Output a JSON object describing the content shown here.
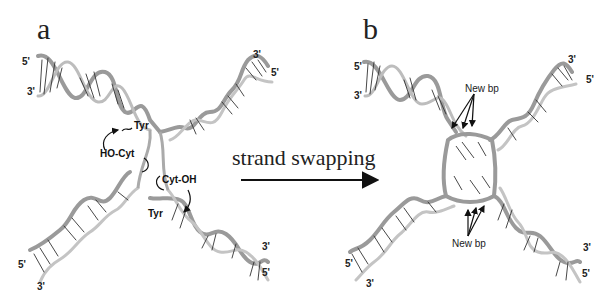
{
  "panels": {
    "a": {
      "label": "a",
      "ends": {
        "top_left_5": "5'",
        "top_left_3": "3'",
        "top_right_3": "3'",
        "top_right_5": "5'",
        "bottom_left_5": "5'",
        "bottom_left_3": "3'",
        "bottom_right_3": "3'",
        "bottom_right_5": "5'"
      },
      "annotations": {
        "tyr_top": "Tyr",
        "ho_cyt": "HO-Cyt",
        "cyt_oh": "Cyt-OH",
        "tyr_bottom": "Tyr"
      }
    },
    "b": {
      "label": "b",
      "ends": {
        "top_left_5": "5'",
        "top_left_3": "3'",
        "top_right_3": "3'",
        "top_right_5": "5'",
        "bottom_left_5": "5'",
        "bottom_left_3": "3'",
        "bottom_right_3": "3'",
        "bottom_right_5": "5'"
      },
      "annotations": {
        "new_bp_top": "New bp",
        "new_bp_bottom": "New bp"
      }
    }
  },
  "process": {
    "label": "strand swapping",
    "arrow": "right-arrow"
  }
}
